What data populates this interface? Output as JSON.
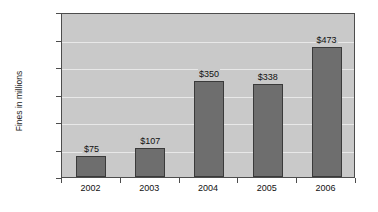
{
  "chart_data": {
    "type": "bar",
    "title": "",
    "xlabel": "",
    "ylabel": "Fines in millions",
    "categories": [
      "2002",
      "2003",
      "2004",
      "2005",
      "2006"
    ],
    "values": [
      75,
      107,
      350,
      338,
      473
    ],
    "data_labels": [
      "$75",
      "$107",
      "$350",
      "$338",
      "$473"
    ],
    "ylim": [
      0,
      600
    ],
    "ytick_values": [
      0,
      100,
      200,
      300,
      400,
      500,
      600
    ],
    "ytick_labels": [
      "$0",
      "$100",
      "$200",
      "$300",
      "$400",
      "$500",
      "$600"
    ],
    "grid": true,
    "legend": false,
    "legend_position": "none",
    "colors": {
      "bar_fill": "#6e6e6e",
      "bar_border": "#3a3a3a",
      "plot_background": "#c9c9c9",
      "gridline": "#e8e8e8",
      "axis": "#4d4d4d",
      "text": "#111111",
      "page_background": "#ffffff"
    }
  }
}
